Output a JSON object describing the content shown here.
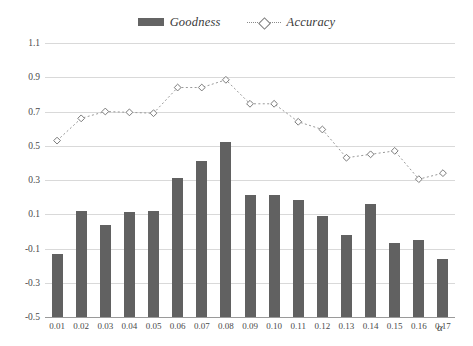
{
  "chart_data": {
    "type": "bar",
    "title": "",
    "xlabel": "α",
    "ylabel": "",
    "categories": [
      "0.01",
      "0.02",
      "0.03",
      "0.04",
      "0.05",
      "0.06",
      "0.07",
      "0.08",
      "0.09",
      "0.10",
      "0.11",
      "0.12",
      "0.13",
      "0.14",
      "0.15",
      "0.16",
      "0.17"
    ],
    "ylim": [
      -0.5,
      1.1
    ],
    "ytick_labels": [
      "1.1",
      "0.9",
      "0.7",
      "0.5",
      "0.3",
      "0.1",
      "-0.1",
      "-0.3",
      "-0.5"
    ],
    "ytick_values": [
      1.1,
      0.9,
      0.7,
      0.5,
      0.3,
      0.1,
      -0.1,
      -0.3,
      -0.5
    ],
    "grid": true,
    "legend_position": "top-center",
    "series": [
      {
        "name": "Goodness",
        "type": "bar",
        "color": "#616161",
        "values": [
          -0.13,
          0.12,
          0.04,
          0.115,
          0.12,
          0.31,
          0.41,
          0.52,
          0.21,
          0.21,
          0.185,
          0.09,
          -0.02,
          0.16,
          -0.07,
          -0.05,
          -0.16
        ]
      },
      {
        "name": "Accuracy",
        "type": "line",
        "color": "#8a8a8a",
        "marker": "diamond",
        "linestyle": "dotted",
        "values": [
          0.53,
          0.66,
          0.7,
          0.695,
          0.69,
          0.84,
          0.84,
          0.885,
          0.745,
          0.745,
          0.64,
          0.595,
          0.43,
          0.45,
          0.47,
          0.305,
          0.34
        ]
      }
    ]
  },
  "legend": {
    "goodness_label": "Goodness",
    "accuracy_label": "Accuracy"
  },
  "axis": {
    "x_title": "α"
  }
}
